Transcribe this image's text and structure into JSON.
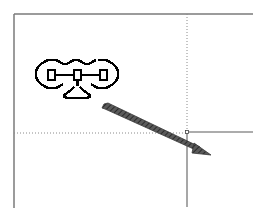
{
  "diagram": {
    "background": "#ffffff",
    "frame_color": "#7a7a7a",
    "guide_color": "#8a8a8a",
    "arrow_color": "#4a4a4a",
    "icon_color": "#000000",
    "frame": {
      "left": 14,
      "top": 14,
      "right": 253,
      "bottom": 208
    },
    "guides": {
      "vertical_x": 187,
      "horizontal_y": 133
    },
    "icon": {
      "name": "chain-link-icon",
      "x": 35,
      "y": 58,
      "width": 88,
      "height": 45
    },
    "arrow": {
      "x1": 104,
      "y1": 106,
      "x2": 210,
      "y2": 155
    }
  }
}
